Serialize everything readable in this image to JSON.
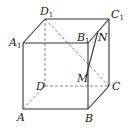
{
  "diagram": {
    "type": "cube",
    "vertices": {
      "A": {
        "label": "A",
        "sub": "",
        "x": 23,
        "y": 109
      },
      "B": {
        "label": "B",
        "sub": "",
        "x": 88,
        "y": 109
      },
      "C": {
        "label": "C",
        "sub": "",
        "x": 109,
        "y": 86
      },
      "D": {
        "label": "D",
        "sub": "",
        "x": 45,
        "y": 86
      },
      "A1": {
        "label": "A",
        "sub": "1",
        "x": 23,
        "y": 43
      },
      "B1": {
        "label": "B",
        "sub": "1",
        "x": 88,
        "y": 43
      },
      "C1": {
        "label": "C",
        "sub": "1",
        "x": 109,
        "y": 19
      },
      "D1": {
        "label": "D",
        "sub": "1",
        "x": 45,
        "y": 19
      },
      "M": {
        "label": "M",
        "sub": "",
        "x": 87,
        "y": 76
      },
      "N": {
        "label": "N",
        "sub": "",
        "x": 98,
        "y": 31
      }
    },
    "solid_edges": [
      "A-B",
      "B-C",
      "A-A1",
      "B-B1",
      "C-C1",
      "A1-B1",
      "B1-C1",
      "C1-D1",
      "D1-A1",
      "N-M"
    ],
    "dashed_edges": [
      "A-D",
      "D-C",
      "D-D1",
      "D1-C"
    ],
    "colors": {
      "line": "#333333",
      "dashed": "#666666",
      "text": "#222222"
    }
  }
}
